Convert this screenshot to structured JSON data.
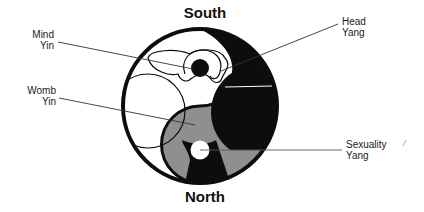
{
  "diagram": {
    "type": "yin-yang body map",
    "orientation": {
      "top": "South",
      "bottom": "North"
    },
    "labels": [
      {
        "id": "mind",
        "line1": "Mind",
        "line2": "Yin",
        "side": "left"
      },
      {
        "id": "womb",
        "line1": "Womb",
        "line2": "Yin",
        "side": "left"
      },
      {
        "id": "head",
        "line1": "Head",
        "line2": "Yang",
        "side": "right"
      },
      {
        "id": "sexuality",
        "line1": "Sexuality",
        "line2": "Yang",
        "side": "right"
      }
    ],
    "stray_mark": "/",
    "colors": {
      "black": "#0d0d0d",
      "gray": "#8f8f8f",
      "white": "#ffffff",
      "leader_line": "#333333"
    }
  }
}
